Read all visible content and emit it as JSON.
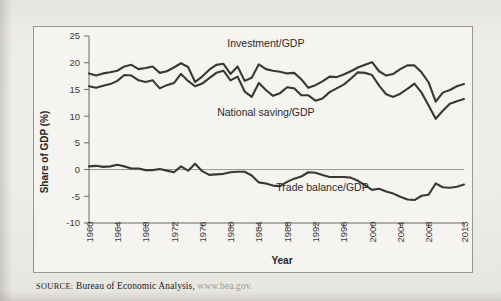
{
  "figure": {
    "source_label": "SOURCE:",
    "source_text": "Bureau of Economic Analysis,",
    "source_url": "www.bea.gov."
  },
  "chart_data": {
    "type": "line",
    "title": "",
    "xlabel": "Year",
    "ylabel": "Share of GDP (%)",
    "xlim": [
      1960,
      2013
    ],
    "ylim": [
      -10,
      25
    ],
    "yticks": [
      25,
      20,
      15,
      10,
      5,
      0,
      -5,
      -10
    ],
    "ytick_labels": [
      "25",
      "20",
      "15",
      "10",
      "5",
      "0",
      "-5",
      "-10"
    ],
    "xticks": [
      1960,
      1964,
      1968,
      1972,
      1976,
      1980,
      1984,
      1988,
      1992,
      1996,
      2000,
      2004,
      2008,
      2013
    ],
    "xtick_labels": [
      "1960",
      "1964",
      "1968",
      "1972",
      "1976",
      "1980",
      "1984",
      "1988",
      "1992",
      "1996",
      "2000",
      "2004",
      "2008",
      "2013"
    ],
    "grid": false,
    "legend_position": "inline-annotations",
    "zero_reference_line": true,
    "x": [
      1960,
      1961,
      1962,
      1963,
      1964,
      1965,
      1966,
      1967,
      1968,
      1969,
      1970,
      1971,
      1972,
      1973,
      1974,
      1975,
      1976,
      1977,
      1978,
      1979,
      1980,
      1981,
      1982,
      1983,
      1984,
      1985,
      1986,
      1987,
      1988,
      1989,
      1990,
      1991,
      1992,
      1993,
      1994,
      1995,
      1996,
      1997,
      1998,
      1999,
      2000,
      2001,
      2002,
      2003,
      2004,
      2005,
      2006,
      2007,
      2008,
      2009,
      2010,
      2011,
      2012,
      2013
    ],
    "series": [
      {
        "name": "Investment/GDP",
        "label": "Investment/GDP",
        "values": [
          18.0,
          17.6,
          18.0,
          18.2,
          18.5,
          19.3,
          19.6,
          18.8,
          19.0,
          19.3,
          18.1,
          18.4,
          19.1,
          19.9,
          19.2,
          16.4,
          17.4,
          18.7,
          19.6,
          19.8,
          17.9,
          19.3,
          16.6,
          17.2,
          19.7,
          18.8,
          18.5,
          18.3,
          18.0,
          18.1,
          16.9,
          15.3,
          15.8,
          16.5,
          17.4,
          17.3,
          17.8,
          18.4,
          19.1,
          19.6,
          20.1,
          18.4,
          17.6,
          17.9,
          18.8,
          19.5,
          19.5,
          18.2,
          16.3,
          12.7,
          14.4,
          14.9,
          15.6,
          16.0
        ]
      },
      {
        "name": "National saving/GDP",
        "label": "National saving/GDP",
        "values": [
          15.6,
          15.3,
          15.7,
          16.0,
          16.6,
          17.7,
          17.6,
          16.7,
          16.4,
          16.7,
          15.2,
          15.8,
          16.2,
          17.9,
          16.6,
          15.6,
          16.1,
          17.1,
          18.1,
          18.5,
          16.7,
          17.4,
          14.6,
          13.6,
          16.2,
          14.9,
          13.8,
          14.3,
          15.4,
          15.2,
          13.9,
          13.9,
          12.9,
          13.3,
          14.5,
          15.2,
          15.9,
          17.0,
          18.2,
          18.1,
          17.7,
          15.7,
          14.1,
          13.6,
          14.2,
          15.1,
          16.1,
          14.4,
          12.0,
          9.5,
          11.0,
          12.3,
          12.8,
          13.2
        ]
      },
      {
        "name": "Trade balance/GDP",
        "label": "Trade balance/GDP",
        "values": [
          0.6,
          0.7,
          0.5,
          0.6,
          0.9,
          0.6,
          0.2,
          0.2,
          -0.1,
          -0.1,
          0.1,
          -0.2,
          -0.5,
          0.6,
          -0.2,
          1.1,
          -0.3,
          -1.0,
          -0.9,
          -0.8,
          -0.5,
          -0.4,
          -0.4,
          -1.1,
          -2.4,
          -2.6,
          -3.0,
          -3.1,
          -2.3,
          -1.7,
          -1.3,
          -0.5,
          -0.6,
          -1.0,
          -1.4,
          -1.4,
          -1.4,
          -1.5,
          -2.1,
          -2.9,
          -3.8,
          -3.6,
          -4.1,
          -4.5,
          -5.1,
          -5.6,
          -5.7,
          -4.9,
          -4.7,
          -2.6,
          -3.3,
          -3.4,
          -3.2,
          -2.8
        ]
      }
    ],
    "annotations": [
      {
        "text": "Investment/GDP",
        "x": 1985,
        "y": 23.0
      },
      {
        "text": "National saving/GDP",
        "x": 1985,
        "y": 10.0
      },
      {
        "text": "Trade balance/GDP",
        "x": 1993,
        "y": -4.1
      }
    ]
  }
}
